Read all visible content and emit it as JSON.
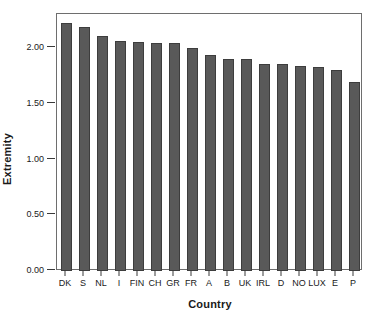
{
  "chart_data": {
    "type": "bar",
    "title": "",
    "subtitle": "",
    "xlabel": "Country",
    "ylabel": "Extremity",
    "categories": [
      "DK",
      "S",
      "NL",
      "I",
      "FIN",
      "CH",
      "GR",
      "FR",
      "A",
      "B",
      "UK",
      "IRL",
      "D",
      "NO",
      "LUX",
      "E",
      "P"
    ],
    "values": [
      2.23,
      2.19,
      2.11,
      2.07,
      2.06,
      2.05,
      2.05,
      2.0,
      1.94,
      1.91,
      1.91,
      1.86,
      1.86,
      1.84,
      1.83,
      1.81,
      1.7
    ],
    "series": [
      {
        "name": "Extremity",
        "values": [
          2.23,
          2.19,
          2.11,
          2.07,
          2.06,
          2.05,
          2.05,
          2.0,
          1.94,
          1.91,
          1.91,
          1.86,
          1.86,
          1.84,
          1.83,
          1.81,
          1.7
        ]
      }
    ],
    "ylim": [
      0.0,
      2.31
    ],
    "xlim": [
      0,
      17
    ],
    "yticks": [
      0.0,
      0.5,
      1.0,
      1.5,
      2.0
    ],
    "ytick_labels": [
      "0.00",
      "0.50",
      "1.00",
      "1.50",
      "2.00"
    ],
    "grid": false,
    "legend": null,
    "legend_position": "none",
    "annotations": [],
    "colors": {
      "bar_fill": "#595959",
      "bar_border": "#3d3d3d",
      "axis": "#3a3a3a",
      "frame": "#6e6e6e",
      "text": "#1a1a1a",
      "background": "#ffffff"
    }
  }
}
